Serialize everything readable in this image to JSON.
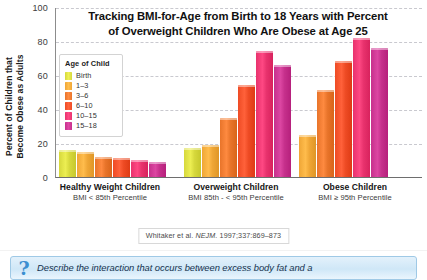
{
  "chart_data": {
    "type": "bar",
    "title": "Tracking BMI-for-Age from Birth to 18 Years with Percent of Overweight Children Who Are Obese at Age 25",
    "title_line1": "Tracking BMI-for-Age from Birth to 18 Years with Percent",
    "title_line2": "of Overweight Children Who Are Obese at Age 25",
    "xlabel": "",
    "ylabel": "Percent of Children that Become Obese as Adults",
    "ylabel_line1": "Percent of Children that",
    "ylabel_line2": "Become Obese as Adults",
    "ylim": [
      0,
      100
    ],
    "yticks": [
      0,
      20,
      40,
      60,
      80,
      100
    ],
    "ytick_labels": [
      "0",
      "20",
      "40",
      "60",
      "80",
      "100"
    ],
    "grid": true,
    "grid_axis": "y",
    "legend_position": "inside-upper-left",
    "legend_title": "Age of Child",
    "categories": [
      "Healthy Weight Children",
      "Overweight Children",
      "Obese Children"
    ],
    "category_sublabels": [
      "BMI < 85th Percentile",
      "BMI 85th - < 95th Percentile",
      "BMI ≥ 95th Percentile"
    ],
    "series": [
      {
        "name": "Birth",
        "color": "#d6d83c",
        "values": [
          16,
          17,
          null
        ]
      },
      {
        "name": "1–3",
        "color": "#efa636",
        "values": [
          15,
          19,
          25
        ]
      },
      {
        "name": "3–6",
        "color": "#e8742a",
        "values": [
          12,
          35,
          51
        ]
      },
      {
        "name": "6–10",
        "color": "#ee4b24",
        "values": [
          11,
          54,
          68
        ]
      },
      {
        "name": "10–15",
        "color": "#e8326d",
        "values": [
          10,
          74,
          82
        ]
      },
      {
        "name": "15–18",
        "color": "#c6308c",
        "values": [
          9,
          66,
          76
        ]
      }
    ],
    "annotation": "Whitaker et al. NEJM. 1997;337:869–873",
    "annotation_author": "Whitaker et al. ",
    "annotation_journal": "NEJM.",
    "annotation_ref": " 1997;337:869–873"
  },
  "legend": {
    "title": "Age of Child",
    "items": [
      {
        "label": "Birth",
        "color": "#d6d83c"
      },
      {
        "label": "1–3",
        "color": "#efa636"
      },
      {
        "label": "3–6",
        "color": "#e8742a"
      },
      {
        "label": "6–10",
        "color": "#ee4b24"
      },
      {
        "label": "10–15",
        "color": "#e8326d"
      },
      {
        "label": "15–18",
        "color": "#c6308c"
      }
    ]
  },
  "caption": {
    "icon": "?",
    "text": "Describe the interaction that occurs between excess body fat and a"
  }
}
